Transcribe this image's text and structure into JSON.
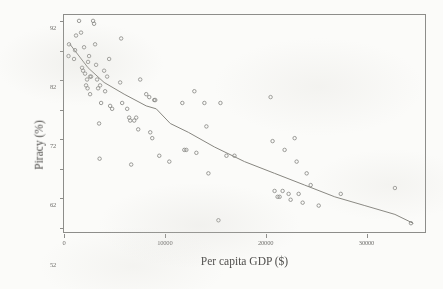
{
  "figure": {
    "background_color": "#fbfbf9",
    "ink_color": "#8d8d8a"
  },
  "chart_data": {
    "type": "scatter",
    "title": "",
    "subtitle": "",
    "xlabel": "Per capita GDP ($)",
    "ylabel": "Piracy (%)",
    "xlim": [
      0,
      36000
    ],
    "ylim": [
      20,
      94
    ],
    "grid": false,
    "legend": null,
    "legend_position": "none",
    "marker_style": "open-circle",
    "marker_color": "#8a8986",
    "xticks": [
      0,
      10000,
      20000,
      30000
    ],
    "xtick_labels": [
      "0",
      "10000",
      "20000",
      "30000"
    ],
    "yticks": [
      22,
      32,
      42,
      52,
      62,
      72,
      82,
      92
    ],
    "ytick_labels": [
      "22",
      "32",
      "42",
      "52",
      "62",
      "72",
      "82",
      "92"
    ],
    "points": [
      {
        "x": 500,
        "y": 84
      },
      {
        "x": 450,
        "y": 80
      },
      {
        "x": 1500,
        "y": 92
      },
      {
        "x": 1200,
        "y": 87
      },
      {
        "x": 1100,
        "y": 82
      },
      {
        "x": 1000,
        "y": 79
      },
      {
        "x": 1700,
        "y": 88
      },
      {
        "x": 2000,
        "y": 83
      },
      {
        "x": 1800,
        "y": 76
      },
      {
        "x": 1900,
        "y": 75
      },
      {
        "x": 2100,
        "y": 74
      },
      {
        "x": 2300,
        "y": 72
      },
      {
        "x": 2400,
        "y": 78
      },
      {
        "x": 2500,
        "y": 80
      },
      {
        "x": 2600,
        "y": 73
      },
      {
        "x": 2700,
        "y": 73
      },
      {
        "x": 2900,
        "y": 92
      },
      {
        "x": 3000,
        "y": 91
      },
      {
        "x": 3100,
        "y": 84
      },
      {
        "x": 3200,
        "y": 77
      },
      {
        "x": 3300,
        "y": 72
      },
      {
        "x": 3400,
        "y": 69
      },
      {
        "x": 3600,
        "y": 70
      },
      {
        "x": 3700,
        "y": 64
      },
      {
        "x": 2200,
        "y": 70
      },
      {
        "x": 2350,
        "y": 69
      },
      {
        "x": 2600,
        "y": 67
      },
      {
        "x": 3500,
        "y": 57
      },
      {
        "x": 3550,
        "y": 45
      },
      {
        "x": 4000,
        "y": 75
      },
      {
        "x": 4100,
        "y": 68
      },
      {
        "x": 4300,
        "y": 73
      },
      {
        "x": 4500,
        "y": 79
      },
      {
        "x": 4600,
        "y": 63
      },
      {
        "x": 4800,
        "y": 62
      },
      {
        "x": 5700,
        "y": 86
      },
      {
        "x": 5600,
        "y": 71
      },
      {
        "x": 5800,
        "y": 64
      },
      {
        "x": 6300,
        "y": 62
      },
      {
        "x": 6500,
        "y": 59
      },
      {
        "x": 6600,
        "y": 58
      },
      {
        "x": 6700,
        "y": 43
      },
      {
        "x": 7000,
        "y": 58
      },
      {
        "x": 7200,
        "y": 59
      },
      {
        "x": 7400,
        "y": 55
      },
      {
        "x": 7600,
        "y": 72
      },
      {
        "x": 8200,
        "y": 67
      },
      {
        "x": 8500,
        "y": 66
      },
      {
        "x": 8600,
        "y": 54
      },
      {
        "x": 8800,
        "y": 52
      },
      {
        "x": 9000,
        "y": 65
      },
      {
        "x": 9100,
        "y": 65
      },
      {
        "x": 9500,
        "y": 46
      },
      {
        "x": 10500,
        "y": 44
      },
      {
        "x": 11800,
        "y": 64
      },
      {
        "x": 12000,
        "y": 48
      },
      {
        "x": 12200,
        "y": 48
      },
      {
        "x": 13000,
        "y": 68
      },
      {
        "x": 13200,
        "y": 47
      },
      {
        "x": 14000,
        "y": 64
      },
      {
        "x": 14200,
        "y": 56
      },
      {
        "x": 14400,
        "y": 40
      },
      {
        "x": 15400,
        "y": 24
      },
      {
        "x": 15600,
        "y": 64
      },
      {
        "x": 16200,
        "y": 46
      },
      {
        "x": 17000,
        "y": 46
      },
      {
        "x": 20600,
        "y": 66
      },
      {
        "x": 20800,
        "y": 51
      },
      {
        "x": 21000,
        "y": 34
      },
      {
        "x": 21300,
        "y": 32
      },
      {
        "x": 21500,
        "y": 32
      },
      {
        "x": 21800,
        "y": 34
      },
      {
        "x": 22000,
        "y": 48
      },
      {
        "x": 22400,
        "y": 33
      },
      {
        "x": 22600,
        "y": 31
      },
      {
        "x": 23000,
        "y": 52
      },
      {
        "x": 23200,
        "y": 44
      },
      {
        "x": 23400,
        "y": 33
      },
      {
        "x": 23800,
        "y": 30
      },
      {
        "x": 24200,
        "y": 40
      },
      {
        "x": 24600,
        "y": 36
      },
      {
        "x": 25400,
        "y": 29
      },
      {
        "x": 27600,
        "y": 33
      },
      {
        "x": 33000,
        "y": 35
      },
      {
        "x": 34600,
        "y": 23
      }
    ],
    "fit_line": {
      "label": "fitted trend",
      "color": "#86857f",
      "points": [
        {
          "x": 600,
          "y": 84
        },
        {
          "x": 2400,
          "y": 76
        },
        {
          "x": 4000,
          "y": 71
        },
        {
          "x": 6000,
          "y": 67
        },
        {
          "x": 8200,
          "y": 63
        },
        {
          "x": 9200,
          "y": 62
        },
        {
          "x": 10600,
          "y": 57
        },
        {
          "x": 12400,
          "y": 54
        },
        {
          "x": 15000,
          "y": 49
        },
        {
          "x": 18000,
          "y": 44
        },
        {
          "x": 21000,
          "y": 40
        },
        {
          "x": 24000,
          "y": 36
        },
        {
          "x": 27000,
          "y": 32
        },
        {
          "x": 30000,
          "y": 29
        },
        {
          "x": 33000,
          "y": 26
        },
        {
          "x": 34800,
          "y": 23
        }
      ]
    }
  }
}
